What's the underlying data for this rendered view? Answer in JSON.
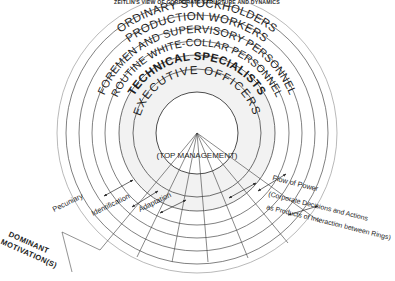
{
  "title": "ZEITLIN'S VIEW OF CORPORATE STRUCTURE AND DYNAMICS",
  "diagram": {
    "type": "concentric-rings",
    "center_label": "(TOP MANAGEMENT)",
    "rings": [
      {
        "index": 1,
        "label": "ORDINARY STOCKHOLDERS",
        "emphasis": "normal"
      },
      {
        "index": 2,
        "label": "PRODUCTION WORKERS",
        "emphasis": "normal"
      },
      {
        "index": 3,
        "label": "FOREMEN AND SUPERVISORY PERSONNEL",
        "emphasis": "normal"
      },
      {
        "index": 4,
        "label": "ROUTINE WHITE-COLLAR PERSONNEL",
        "emphasis": "normal"
      },
      {
        "index": 5,
        "label": "TECHNICAL SPECIALISTS",
        "emphasis": "bold"
      },
      {
        "index": 6,
        "label": "EXECUTIVE OFFICERS",
        "emphasis": "spaced"
      }
    ]
  },
  "annotations": {
    "left_axis_title_line1": "DOMINANT",
    "left_axis_title_line2": "MOTIVATION(S)",
    "motivations": [
      "Pecuniary",
      "Identification",
      "Adaptation"
    ],
    "right_caption_line1": "Flow of Power",
    "right_caption_line2": "(Corporate Decisions and Actions",
    "right_caption_line3": "as Products of Interaction between Rings)"
  },
  "colors": {
    "ink": "#1e1e1e",
    "stroke": "#4a4a4a",
    "band": "#f2f2f2",
    "background": "#ffffff"
  }
}
